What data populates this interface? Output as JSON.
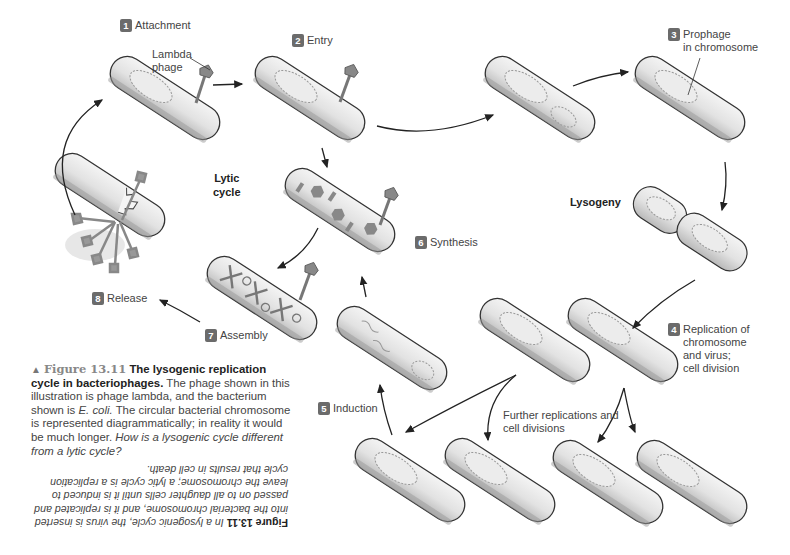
{
  "diagram": {
    "title": "The lysogenic replication cycle in bacteriophages",
    "cycle_labels": {
      "lytic": "Lytic\ncycle",
      "lysogeny": "Lysogeny"
    },
    "steps": [
      {
        "number": "1",
        "label": "Attachment"
      },
      {
        "number": "2",
        "label": "Entry"
      },
      {
        "number": "3",
        "label": "Prophage\nin chromosome"
      },
      {
        "number": "4",
        "label": "Replication of\nchromosome\nand virus;\ncell division"
      },
      {
        "number": "5",
        "label": "Induction"
      },
      {
        "number": "6",
        "label": "Synthesis"
      },
      {
        "number": "7",
        "label": "Assembly"
      },
      {
        "number": "8",
        "label": "Release"
      }
    ],
    "annotations": {
      "lambda_phage": "Lambda\nphage",
      "further": "Further replications and\ncell divisions"
    },
    "colors": {
      "badge": "#6b6b6b",
      "cell_fill": "#e6e6e6",
      "cell_outline": "#333333",
      "arrow": "#222222"
    }
  },
  "caption": {
    "marker": "▲",
    "figure_number": "Figure 13.11",
    "bold_title": "The lysogenic replication cycle in bacteriophages.",
    "body": "The phage shown in this illustration is phage lambda, and the bacterium shown is",
    "species": "E. coli.",
    "body2": "The circular bacterial chromosome is represented diagrammatically; in reality it would be much longer.",
    "question": "How is a lysogenic cycle different from a lytic cycle?"
  },
  "answer": {
    "figure_number": "Figure 13.11",
    "text": "In a lysogenic cycle, the virus is inserted into the bacterial chromosome, and it is replicated and passed on to all daughter cells until it is induced to leave the chromosome; a lytic cycle is a replication cycle that results in cell death."
  }
}
